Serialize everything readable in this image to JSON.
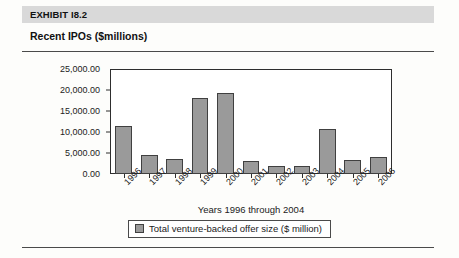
{
  "exhibit": {
    "label": "EXHIBIT I8.2",
    "subtitle": "Recent IPOs ($millions)"
  },
  "colors": {
    "bar_fill": "#9a9a9a",
    "bar_border": "#404040",
    "band": "#d9d9d9",
    "rule": "#4a4a4a",
    "axis": "#2e2e2e"
  },
  "legend": {
    "swatch_name": "legend-color-swatch",
    "text": "Total venture-backed offer size ($ million)"
  },
  "chart_data": {
    "type": "bar",
    "title": "Recent IPOs ($millions)",
    "subtitle": "EXHIBIT I8.2",
    "xlabel": "Years 1996 through 2004",
    "ylabel": "",
    "ylim": [
      0,
      25000
    ],
    "grid": false,
    "legend_position": "bottom",
    "ytick_labels": [
      "25,000.00",
      "20,000.00",
      "15,000.00",
      "10,000.00",
      "5,000.00",
      "0.00"
    ],
    "ytick_values": [
      25000,
      20000,
      15000,
      10000,
      5000,
      0
    ],
    "categories": [
      "1996",
      "1997",
      "1998",
      "1999",
      "2000",
      "2001",
      "2002",
      "2003",
      "2004",
      "2005",
      "2006"
    ],
    "series": [
      {
        "name": "Total venture-backed offer size ($ million)",
        "values": [
          11600,
          4500,
          3500,
          18300,
          19400,
          3100,
          2000,
          2000,
          10900,
          3300,
          4200
        ]
      }
    ]
  }
}
